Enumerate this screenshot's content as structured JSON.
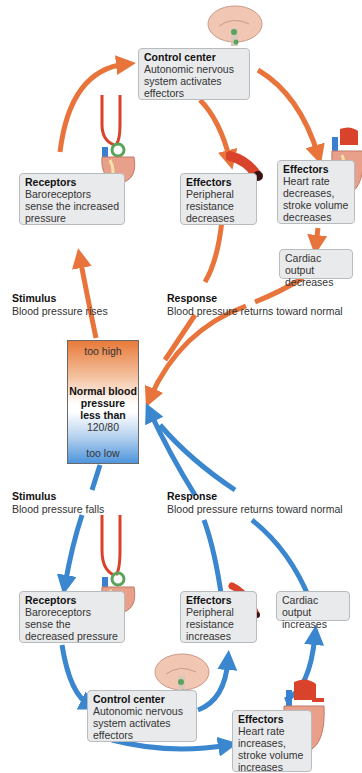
{
  "colors": {
    "increase_arrow": "#e8743b",
    "decrease_arrow": "#3a86cf",
    "box_fill": "#e9eaeb",
    "box_border": "#b9bcbf"
  },
  "gauge": {
    "top_label": "too high",
    "center_title_lines": [
      "Normal blood",
      "pressure",
      "less than"
    ],
    "center_value": "120/80",
    "bottom_label": "too low"
  },
  "top_loop": {
    "control_center": {
      "title": "Control center",
      "text": "Autonomic nervous system activates effectors",
      "icon": "brain-icon"
    },
    "receptors": {
      "title": "Receptors",
      "text": "Baroreceptors sense the increased pressure",
      "icon": "heart-with-arteries-icon"
    },
    "effectors_vessel": {
      "title": "Effectors",
      "text": "Peripheral resistance decreases",
      "icon": "blood-vessel-icon"
    },
    "effectors_heart": {
      "title": "Effectors",
      "text": "Heart rate decreases, stroke volume decreases",
      "icon": "heart-icon"
    },
    "cardiac_output": {
      "text": "Cardiac output decreases"
    },
    "stimulus": {
      "title": "Stimulus",
      "text": "Blood pressure rises"
    },
    "response": {
      "title": "Response",
      "text": "Blood pressure returns toward normal"
    }
  },
  "bottom_loop": {
    "stimulus": {
      "title": "Stimulus",
      "text": "Blood pressure falls"
    },
    "response": {
      "title": "Response",
      "text": "Blood pressure returns toward normal"
    },
    "receptors": {
      "title": "Receptors",
      "text": "Baroreceptors sense the decreased pressure",
      "icon": "heart-with-arteries-icon"
    },
    "effectors_vessel": {
      "title": "Effectors",
      "text": "Peripheral resistance increases",
      "icon": "blood-vessel-icon"
    },
    "cardiac_output": {
      "text": "Cardiac output increases"
    },
    "control_center": {
      "title": "Control center",
      "text": "Autonomic nervous system activates effectors",
      "icon": "brain-icon"
    },
    "effectors_heart": {
      "title": "Effectors",
      "text": "Heart rate increases, stroke volume increases",
      "icon": "heart-icon"
    }
  }
}
